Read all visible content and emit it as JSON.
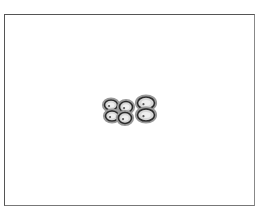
{
  "figure": {
    "frame_color": "#555555",
    "background_color": "#ffffff",
    "cell_wall_color": "#2a2a2a",
    "cell_halo_color": "#9a9a9a",
    "cell_fill_color": "#d8d8d8",
    "cells": [
      {
        "cx": 111,
        "cy": 105,
        "rx": 6.5,
        "ry": 5
      },
      {
        "cx": 112,
        "cy": 116,
        "rx": 6.5,
        "ry": 5
      },
      {
        "cx": 126,
        "cy": 107,
        "rx": 6.5,
        "ry": 5.5
      },
      {
        "cx": 125,
        "cy": 118,
        "rx": 6.5,
        "ry": 5.5
      },
      {
        "cx": 146,
        "cy": 103,
        "rx": 8.5,
        "ry": 6
      },
      {
        "cx": 146,
        "cy": 115,
        "rx": 8.5,
        "ry": 6
      }
    ]
  }
}
